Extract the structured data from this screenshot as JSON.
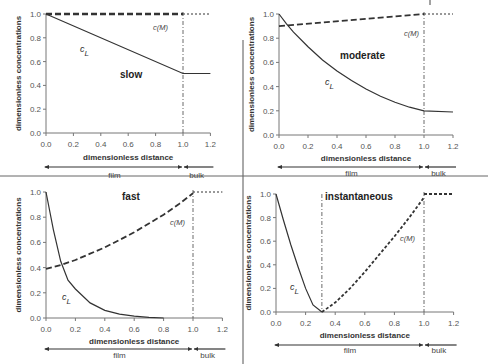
{
  "figure": {
    "separators": {
      "vertical_x": 243,
      "horizontal_y": 176
    }
  },
  "chart_data": [
    {
      "id": "slow",
      "type": "line",
      "title": "slow",
      "xlabel": "dimensionless distance",
      "ylabel": "dimensionless concentrations",
      "xlim": [
        0,
        1.2
      ],
      "ylim": [
        0,
        1.0
      ],
      "xticks": [
        "0.0",
        "0.2",
        "0.4",
        "0.6",
        "0.8",
        "1.0",
        "1.2"
      ],
      "yticks": [
        "0.0",
        "0.2",
        "0.4",
        "0.6",
        "0.8",
        "1.0"
      ],
      "grid": false,
      "regions": {
        "film": "film",
        "bulk": "bulk"
      },
      "interface_x": 1.0,
      "series": [
        {
          "name": "c_L",
          "style": "solid",
          "x": [
            0,
            1.0,
            1.2
          ],
          "y": [
            1.0,
            0.5,
            0.5
          ]
        },
        {
          "name": "c(M)",
          "style": "dashed",
          "x": [
            0,
            1.0
          ],
          "y": [
            1.0,
            1.0
          ]
        },
        {
          "name": "c(M) bulk",
          "style": "dotted",
          "x": [
            1.0,
            1.2
          ],
          "y": [
            1.0,
            1.0
          ]
        }
      ],
      "labels": {
        "cL": "c",
        "cL_sub": "L",
        "cM": "c(M)"
      },
      "layout": {
        "x0": 46,
        "x1": 183,
        "y0": 133,
        "y1": 14,
        "title_x": 120,
        "title_y": 78,
        "cL_x": 80,
        "cL_y": 52,
        "cM_x": 153,
        "cM_y": 30,
        "xlabel_y": 160,
        "arrow_y": 167,
        "region_y": 178
      }
    },
    {
      "id": "moderate",
      "type": "line",
      "title": "moderate",
      "xlabel": "dimensionless distance",
      "ylabel": "dimensionless concentrations",
      "xlim": [
        0,
        1.2
      ],
      "ylim": [
        0,
        1.0
      ],
      "xticks": [
        "0.0",
        "0.2",
        "0.4",
        "0.6",
        "0.8",
        "1.0",
        "1.2"
      ],
      "yticks": [
        "0.0",
        "0.2",
        "0.4",
        "0.6",
        "0.8",
        "1.0"
      ],
      "grid": false,
      "regions": {
        "film": "film",
        "bulk": "bulk"
      },
      "interface_x": 1.0,
      "series": [
        {
          "name": "c_L",
          "style": "solid",
          "x": [
            0,
            0.05,
            0.1,
            0.2,
            0.3,
            0.4,
            0.5,
            0.6,
            0.7,
            0.8,
            0.9,
            1.0,
            1.2
          ],
          "y": [
            1.0,
            0.92,
            0.85,
            0.73,
            0.62,
            0.53,
            0.45,
            0.38,
            0.32,
            0.27,
            0.23,
            0.2,
            0.19
          ]
        },
        {
          "name": "c(M)",
          "style": "dashed",
          "x": [
            0,
            1.0
          ],
          "y": [
            0.9,
            1.0
          ]
        },
        {
          "name": "c(M) bulk",
          "style": "dotted",
          "x": [
            1.0,
            1.2
          ],
          "y": [
            1.0,
            1.0
          ]
        }
      ],
      "labels": {
        "cL": "c",
        "cL_sub": "L",
        "cM": "c(M)"
      },
      "layout": {
        "x0": 279,
        "x1": 424,
        "y0": 135,
        "y1": 14,
        "title_x": 340,
        "title_y": 59,
        "cL_x": 325,
        "cL_y": 85,
        "cM_x": 404,
        "cM_y": 36,
        "xlabel_y": 161,
        "arrow_y": 167,
        "region_y": 176
      }
    },
    {
      "id": "fast",
      "type": "line",
      "title": "fast",
      "xlabel": "dimensionless distance",
      "ylabel": "dimensionless concentrations",
      "xlim": [
        0,
        1.2
      ],
      "ylim": [
        0,
        1.0
      ],
      "xticks": [
        "0.0",
        "0.2",
        "0.4",
        "0.6",
        "0.8",
        "1.0",
        "1.2"
      ],
      "yticks": [
        "0.0",
        "0.2",
        "0.4",
        "0.6",
        "0.8",
        "1.0"
      ],
      "grid": false,
      "regions": {
        "film": "film",
        "bulk": "bulk"
      },
      "interface_x": 1.0,
      "series": [
        {
          "name": "c_L",
          "style": "solid",
          "x": [
            0,
            0.05,
            0.1,
            0.15,
            0.2,
            0.3,
            0.4,
            0.5,
            0.6,
            0.7,
            0.8
          ],
          "y": [
            1.0,
            0.7,
            0.45,
            0.3,
            0.23,
            0.12,
            0.06,
            0.03,
            0.015,
            0.005,
            0.0
          ]
        },
        {
          "name": "c(M)",
          "style": "dashed",
          "x": [
            0,
            0.1,
            0.2,
            0.3,
            0.4,
            0.5,
            0.6,
            0.7,
            0.8,
            0.9,
            1.0
          ],
          "y": [
            0.39,
            0.42,
            0.46,
            0.51,
            0.56,
            0.62,
            0.68,
            0.75,
            0.82,
            0.9,
            0.99
          ]
        },
        {
          "name": "c(M) bulk",
          "style": "dotted",
          "x": [
            1.0,
            1.2
          ],
          "y": [
            1.0,
            1.0
          ]
        }
      ],
      "labels": {
        "cL": "c",
        "cL_sub": "L",
        "cM": "c(M)"
      },
      "layout": {
        "x0": 46,
        "x1": 193,
        "y0": 318,
        "y1": 192,
        "title_x": 122,
        "title_y": 200,
        "cL_x": 62,
        "cL_y": 300,
        "cM_x": 170,
        "cM_y": 225,
        "xlabel_y": 344,
        "arrow_y": 349,
        "region_y": 358
      }
    },
    {
      "id": "instantaneous",
      "type": "line",
      "title": "instantaneous",
      "xlabel": "dimensionless distance",
      "ylabel": "dimensionless concentrations",
      "xlim": [
        0,
        1.2
      ],
      "ylim": [
        0,
        1.0
      ],
      "xticks": [
        "0.0",
        "0.2",
        "0.4",
        "0.6",
        "0.8",
        "1.0",
        "1.2"
      ],
      "yticks": [
        "0.0",
        "0.2",
        "0.4",
        "0.6",
        "0.8",
        "1.0"
      ],
      "grid": false,
      "regions": {
        "film": "film",
        "bulk": "bulk"
      },
      "interface_x": 1.0,
      "reaction_plane_x": 0.31,
      "series": [
        {
          "name": "c_L",
          "style": "solid",
          "x": [
            0,
            0.05,
            0.1,
            0.15,
            0.2,
            0.25,
            0.31
          ],
          "y": [
            1.0,
            0.78,
            0.57,
            0.38,
            0.2,
            0.06,
            0.0
          ]
        },
        {
          "name": "c(M)",
          "style": "dashed",
          "x": [
            0.31,
            0.4,
            0.5,
            0.6,
            0.7,
            0.8,
            0.9,
            1.0
          ],
          "y": [
            0.0,
            0.08,
            0.2,
            0.34,
            0.49,
            0.64,
            0.8,
            0.97
          ]
        },
        {
          "name": "c(M) bulk",
          "style": "dashed",
          "x": [
            1.0,
            1.2
          ],
          "y": [
            1.0,
            1.0
          ]
        }
      ],
      "labels": {
        "cL": "c",
        "cL_sub": "L",
        "cM": "c(M)"
      },
      "layout": {
        "x0": 276,
        "x1": 424,
        "y0": 312,
        "y1": 194,
        "title_x": 325,
        "title_y": 200,
        "cL_x": 290,
        "cL_y": 290,
        "cM_x": 400,
        "cM_y": 241,
        "xlabel_y": 338,
        "arrow_y": 345,
        "region_y": 353
      }
    }
  ]
}
